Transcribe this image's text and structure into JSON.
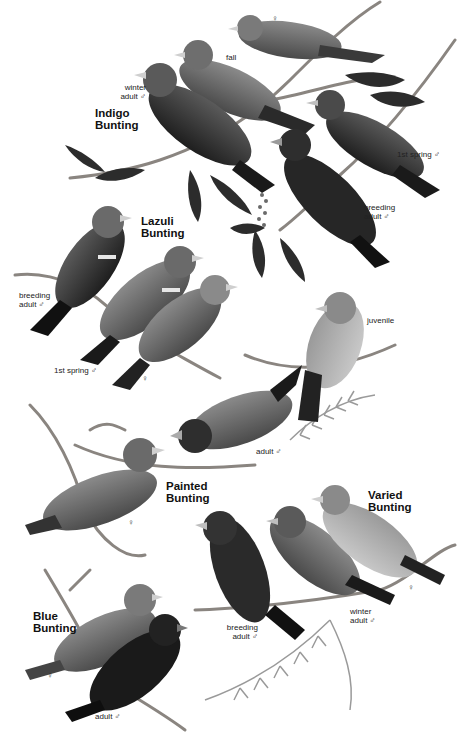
{
  "plate": {
    "background": "#ffffff",
    "ink": "#111111",
    "species": [
      {
        "name_line1": "Indigo",
        "name_line2": "Bunting",
        "labels": {
          "female": "♀",
          "fall": "fall",
          "winter_adult_male_1": "winter",
          "winter_adult_male_2": "adult ♂",
          "first_spring_male": "1st spring ♂",
          "breeding_adult_male_1": "breeding",
          "breeding_adult_male_2": "adult ♂"
        }
      },
      {
        "name_line1": "Lazuli",
        "name_line2": "Bunting",
        "labels": {
          "breeding_adult_male_1": "breeding",
          "breeding_adult_male_2": "adult ♂",
          "first_spring_male": "1st spring ♂",
          "female": "♀"
        }
      },
      {
        "name_line1": "Painted",
        "name_line2": "Bunting",
        "labels": {
          "juvenile": "juvenile",
          "adult_male": "adult ♂",
          "female": "♀"
        }
      },
      {
        "name_line1": "Varied",
        "name_line2": "Bunting",
        "labels": {
          "breeding_adult_male_1": "breeding",
          "breeding_adult_male_2": "adult ♂",
          "winter_adult_male_1": "winter",
          "winter_adult_male_2": "adult ♂",
          "female": "♀"
        }
      },
      {
        "name_line1": "Blue",
        "name_line2": "Bunting",
        "labels": {
          "female": "♀",
          "adult_male": "adult ♂"
        }
      }
    ]
  }
}
